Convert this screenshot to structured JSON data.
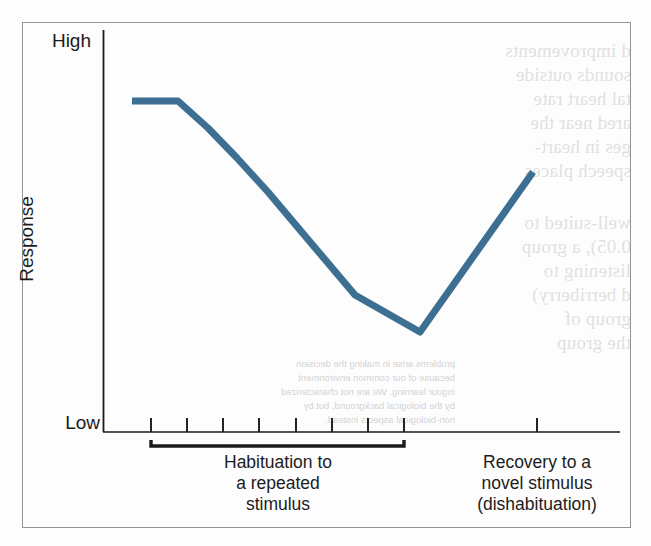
{
  "figure": {
    "background_color": "#fdfdfd",
    "frame_color": "#949494",
    "axis_color": "#1a1a1a",
    "line_color": "#3d6f92"
  },
  "axes": {
    "y_label": "Response",
    "y_tick_high": "High",
    "y_tick_low": "Low",
    "x_label": ""
  },
  "captions": {
    "habituation_line1": "Habituation to",
    "habituation_line2": "a repeated",
    "habituation_line3": "stimulus",
    "recovery_line1": "Recovery to a",
    "recovery_line2": "novel stimulus",
    "recovery_line3": "(dishabituation)"
  },
  "ghost_text": {
    "right_column": [
      "d improvements",
      "sounds outside",
      "tal heart rate",
      "ared near the",
      "ges in heart-",
      "speech places",
      "well-suited to",
      "0.05), a group",
      "listening to",
      "d berriberry)",
      "group of",
      "the group"
    ],
    "lower_small": [
      "problems arise in making the decision",
      "because of our common environment",
      "ingour learning. We are not characterized",
      "by the biological background, but by",
      "non-biological aspects instead."
    ]
  },
  "chart_data": {
    "type": "line",
    "title": "",
    "xlabel": "",
    "ylabel": "Response",
    "ylim": [
      0,
      1
    ],
    "xlim": [
      0,
      1
    ],
    "grid": false,
    "legend": false,
    "y_tick_labels": [
      "Low",
      "High"
    ],
    "x_tick_positions_px": [
      151,
      187,
      223,
      259,
      296,
      332,
      368,
      404,
      537
    ],
    "x_tick_count_habituation": 8,
    "x_tick_count_recovery": 1,
    "series": [
      {
        "name": "Response to repeated stimulus",
        "color": "#3d6f92",
        "width_px": 7,
        "points_px": [
          [
            132,
            101
          ],
          [
            178,
            101
          ],
          [
            208,
            128
          ],
          [
            237,
            158
          ],
          [
            268,
            192
          ],
          [
            300,
            230
          ],
          [
            355,
            295
          ],
          [
            420,
            332
          ],
          [
            533,
            172
          ]
        ],
        "points_normalized": [
          [
            0.06,
            0.92
          ],
          [
            0.15,
            0.92
          ],
          [
            0.2,
            0.84
          ],
          [
            0.26,
            0.75
          ],
          [
            0.32,
            0.66
          ],
          [
            0.38,
            0.56
          ],
          [
            0.49,
            0.38
          ],
          [
            0.61,
            0.28
          ],
          [
            0.83,
            0.74
          ]
        ]
      }
    ],
    "annotations": [
      {
        "text": "Habituation to a repeated stimulus",
        "bracket_start_px": 151,
        "bracket_end_px": 404,
        "bracket_y_px": 443
      },
      {
        "text": "Recovery to a novel stimulus (dishabituation)",
        "tick_px": 537
      }
    ]
  }
}
